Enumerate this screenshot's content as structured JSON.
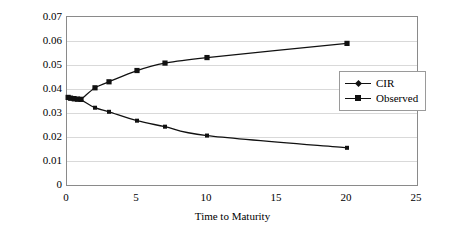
{
  "chart_data": {
    "type": "line",
    "title": "",
    "xlabel": "Time to Maturity",
    "ylabel": "Yield",
    "xlim": [
      0,
      25
    ],
    "ylim": [
      0,
      0.07
    ],
    "xticks": [
      0,
      5,
      10,
      15,
      20,
      25
    ],
    "xtick_labels": [
      "0",
      "5",
      "10",
      "15",
      "20",
      "25"
    ],
    "yticks": [
      0,
      0.01,
      0.02,
      0.03,
      0.04,
      0.05,
      0.06,
      0.07
    ],
    "ytick_labels": [
      "0",
      "0.01",
      "0.02",
      "0.03",
      "0.04",
      "0.05",
      "0.06",
      "0.07"
    ],
    "grid": "horizontal",
    "legend_position": "upper-right-inside",
    "series": [
      {
        "name": "CIR",
        "marker": "small-square",
        "color": "#111111",
        "x": [
          0.08,
          0.25,
          0.5,
          0.75,
          1.0,
          2.0,
          3.0,
          5.0,
          7.0,
          10.0,
          20.0
        ],
        "y": [
          0.0365,
          0.036,
          0.0357,
          0.0356,
          0.0355,
          0.0322,
          0.0305,
          0.0268,
          0.0243,
          0.0206,
          0.0155
        ]
      },
      {
        "name": "Observed",
        "marker": "square",
        "color": "#111111",
        "x": [
          0.08,
          0.25,
          0.5,
          0.75,
          1.0,
          2.0,
          3.0,
          5.0,
          7.0,
          10.0,
          20.0
        ],
        "y": [
          0.0365,
          0.0362,
          0.036,
          0.0358,
          0.0357,
          0.0405,
          0.043,
          0.0477,
          0.0508,
          0.0531,
          0.059
        ]
      }
    ],
    "legend": [
      {
        "label": "CIR",
        "marker": "diamond"
      },
      {
        "label": "Observed",
        "marker": "square"
      }
    ]
  }
}
